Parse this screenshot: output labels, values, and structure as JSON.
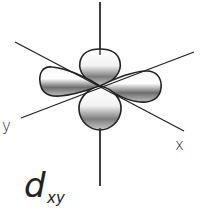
{
  "diagram": {
    "orbital_name": "d",
    "orbital_subscript": "xy",
    "axes": {
      "x_label": "x",
      "y_label": "y"
    },
    "colors": {
      "line": "#222222",
      "lobe_light": "#ffffff",
      "lobe_dark": "#7a7a7a",
      "background": "#ffffff"
    }
  }
}
